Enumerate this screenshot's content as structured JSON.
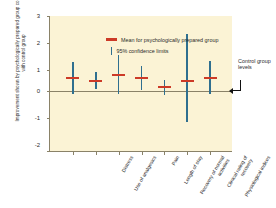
{
  "chart_data": {
    "type": "scatter",
    "title": "",
    "xlabel": "",
    "ylabel": "Improvement shown by psychologically prepared group compared with control group",
    "ylim": [
      -2,
      3
    ],
    "yticks": [
      3,
      2,
      1,
      0,
      -1,
      -2
    ],
    "grid": false,
    "legend_position": "top-left",
    "zero_reference_label": "Control group levels",
    "categories": [
      "Distress",
      "Use of analgesics",
      "Pain",
      "Length of stay",
      "Recovery of normal activities",
      "Clinical rating of recovery",
      "Physiological indices"
    ],
    "series": [
      {
        "name": "Mean for psychologically prepared group",
        "values": [
          0.73,
          0.61,
          0.84,
          0.73,
          0.4,
          0.61,
          0.72
        ]
      },
      {
        "name": "95% confidence limits lower",
        "values": [
          0.13,
          0.33,
          0.13,
          0.29,
          0.1,
          -0.88,
          0.12
        ]
      },
      {
        "name": "95% confidence limits upper",
        "values": [
          1.32,
          0.93,
          1.56,
          1.16,
          0.66,
          2.32,
          1.34
        ]
      }
    ],
    "legend": [
      {
        "marker": "red-dash",
        "label": "Mean for psychologically prepared group"
      },
      {
        "marker": "blue-bar",
        "label": "95% confidence limits"
      }
    ],
    "colors": {
      "mean": "#cc3a27",
      "confidence": "#2f6f8f",
      "plot_background": "#fbf3d5",
      "axis": "#8a8268",
      "text": "#2b2b2b"
    }
  }
}
